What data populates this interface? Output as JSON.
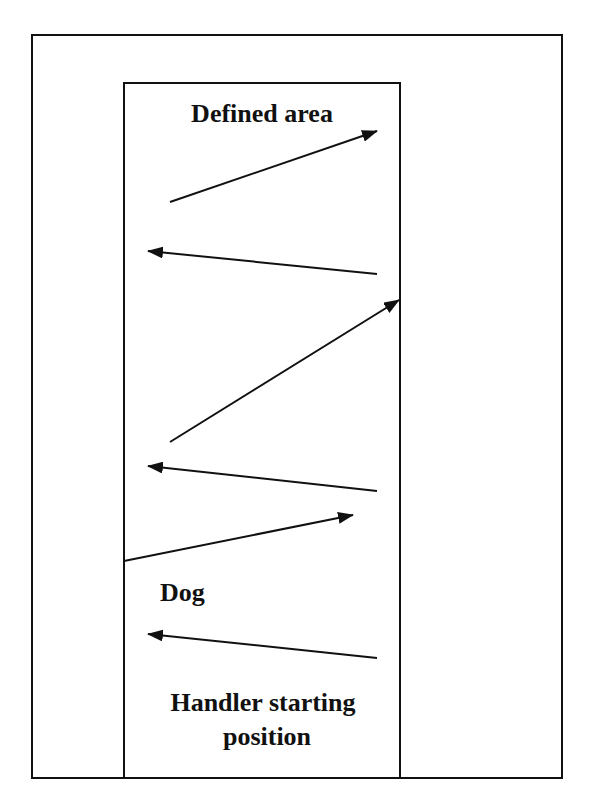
{
  "diagram": {
    "type": "search-pattern",
    "labels": {
      "defined_area": "Defined area",
      "dog": "Dog",
      "handler_line1": "Handler starting",
      "handler_line2": "position"
    },
    "colors": {
      "stroke": "#111111",
      "background": "#ffffff"
    },
    "outer_box": {
      "x1": 32,
      "y1": 35,
      "x2": 562,
      "y2": 778
    },
    "inner_area": {
      "x1": 124,
      "y1": 83,
      "x2": 400,
      "y2": 778
    },
    "arrows": [
      {
        "from": [
          170,
          202
        ],
        "to": [
          377,
          131
        ],
        "direction": "right"
      },
      {
        "from": [
          377,
          274
        ],
        "to": [
          148,
          251
        ],
        "direction": "left"
      },
      {
        "from": [
          170,
          442
        ],
        "to": [
          399,
          300
        ],
        "direction": "right"
      },
      {
        "from": [
          377,
          491
        ],
        "to": [
          148,
          466
        ],
        "direction": "left"
      },
      {
        "from": [
          124,
          561
        ],
        "to": [
          353,
          515
        ],
        "direction": "right"
      },
      {
        "from": [
          377,
          658
        ],
        "to": [
          148,
          634
        ],
        "direction": "left"
      }
    ]
  }
}
